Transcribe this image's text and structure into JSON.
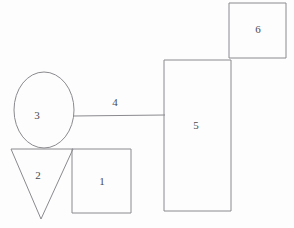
{
  "diagram": {
    "canvas": {
      "width": 294,
      "height": 228,
      "background": "#fdfdfd"
    },
    "stroke_color": "#8a8a8f",
    "label_color": "#4a4a50",
    "shapes": [
      {
        "id": "shape-1",
        "label": "1",
        "type": "square",
        "label_x": 102,
        "label_y": 181,
        "geometry": {
          "x": 72,
          "y": 149,
          "width": 59,
          "height": 64
        },
        "points": "72,149 131,149 131,213 72,213 72,149"
      },
      {
        "id": "shape-2",
        "label": "2",
        "type": "triangle",
        "label_x": 38,
        "label_y": 175,
        "geometry": {
          "x1": 11,
          "y1": 149,
          "x2": 73,
          "y2": 149,
          "x3": 41,
          "y3": 219
        },
        "points": "11,149 73,149 41,219 11,149"
      },
      {
        "id": "shape-3",
        "label": "3",
        "type": "ellipse",
        "label_x": 37,
        "label_y": 115,
        "geometry": {
          "cx": 44,
          "cy": 110,
          "rx": 30,
          "ry": 38
        }
      },
      {
        "id": "shape-4",
        "label": "4",
        "type": "line",
        "label_x": 115,
        "label_y": 102,
        "geometry": {
          "x1": 73,
          "y1": 116,
          "x2": 165,
          "y2": 115
        }
      },
      {
        "id": "shape-5",
        "label": "5",
        "type": "rectangle",
        "label_x": 196,
        "label_y": 125,
        "geometry": {
          "x": 164,
          "y": 60,
          "width": 67,
          "height": 151
        },
        "points": "164,60 231,60 231,211 164,211 164,60"
      },
      {
        "id": "shape-6",
        "label": "6",
        "type": "rectangle",
        "label_x": 258,
        "label_y": 29,
        "geometry": {
          "x": 229,
          "y": 3,
          "width": 57,
          "height": 55
        },
        "points": "229,3 286,3 286,58 229,58 229,3"
      }
    ]
  }
}
